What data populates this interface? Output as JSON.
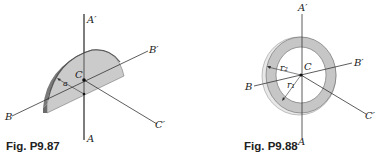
{
  "figures": [
    {
      "caption": "Fig. P9.87",
      "shape": "half-disk plate",
      "labels": {
        "a_prime": "A′",
        "a": "A",
        "b_prime": "B′",
        "b": "B",
        "c_prime": "C′",
        "c": "C",
        "dim": "a"
      }
    },
    {
      "caption": "Fig. P9.88",
      "shape": "annular ring plate",
      "labels": {
        "a_prime": "A′",
        "a": "A",
        "b_prime": "B′",
        "b": "B",
        "c_prime": "C′",
        "c": "C",
        "r2": "r₂",
        "r1": "r₁"
      }
    }
  ],
  "colors": {
    "fill": "#c8c8c8",
    "edge": "#8a8a8a",
    "line": "#333333"
  }
}
